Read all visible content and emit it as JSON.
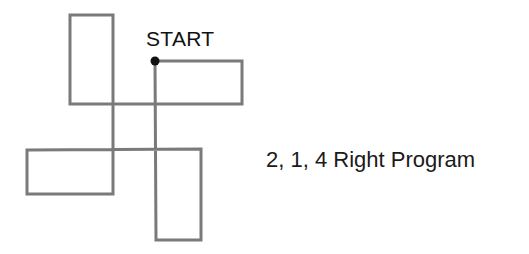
{
  "diagram": {
    "start_label": "START",
    "caption": "2, 1, 4 Right Program",
    "line_color": "#7a7a7a",
    "dot_color": "#111111",
    "start_point": [
      155,
      61
    ],
    "path_points": [
      [
        155,
        61
      ],
      [
        242,
        61
      ],
      [
        242,
        104
      ],
      [
        70,
        104
      ],
      [
        70,
        15
      ],
      [
        113,
        15
      ],
      [
        113,
        194
      ],
      [
        27,
        194
      ],
      [
        27,
        150
      ],
      [
        201,
        149
      ],
      [
        201,
        240
      ],
      [
        156,
        240
      ],
      [
        155,
        61
      ]
    ]
  }
}
